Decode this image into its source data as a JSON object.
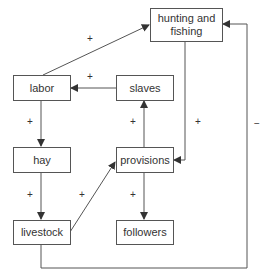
{
  "nodes": {
    "hunting": {
      "label": "hunting and fishing"
    },
    "labor": {
      "label": "labor"
    },
    "slaves": {
      "label": "slaves"
    },
    "hay": {
      "label": "hay"
    },
    "provisions": {
      "label": "provisions"
    },
    "livestock": {
      "label": "livestock"
    },
    "followers": {
      "label": "followers"
    }
  },
  "edges": [
    {
      "from": "labor",
      "to": "hunting",
      "sign": "+"
    },
    {
      "from": "slaves",
      "to": "labor",
      "sign": "+"
    },
    {
      "from": "labor",
      "to": "hay",
      "sign": "+"
    },
    {
      "from": "provisions",
      "to": "slaves",
      "sign": "+"
    },
    {
      "from": "hunting",
      "to": "provisions",
      "sign": "+"
    },
    {
      "from": "livestock",
      "to": "hunting",
      "sign": "−"
    },
    {
      "from": "hay",
      "to": "livestock",
      "sign": "+"
    },
    {
      "from": "livestock",
      "to": "provisions",
      "sign": "+"
    },
    {
      "from": "provisions",
      "to": "followers",
      "sign": "+"
    }
  ],
  "colors": {
    "line": "#444444",
    "text": "#333333"
  }
}
